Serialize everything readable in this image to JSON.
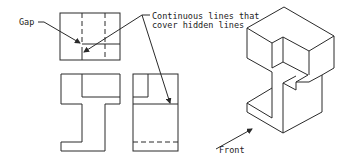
{
  "annotations": {
    "gap": "Gap",
    "continuous_line1": "Continuous lines that",
    "continuous_line2": "cover hidden lines",
    "front": "Front"
  },
  "views": [
    "top-view",
    "front-view",
    "side-view",
    "isometric-view"
  ],
  "colors": {
    "line": "#2a2a2a",
    "background": "#ffffff"
  }
}
